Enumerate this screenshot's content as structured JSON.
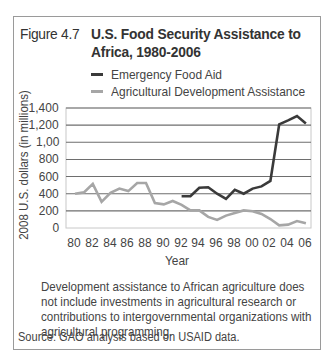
{
  "figure": {
    "number": "Figure 4.7",
    "title": "U.S. Food Security Assistance to Africa, 1980-2006",
    "note": "Development assistance to African agriculture does not include investments in agricultural research or contributions to intergovernmental organizations with agricultural programming.",
    "source": "Source: GAO analysis based on USAID data."
  },
  "colors": {
    "emergency": "#3a3a3a",
    "agricultural": "#a6a6a6",
    "grid": "#6e6e6e",
    "border": "#9a9a9a"
  },
  "chart_data": {
    "type": "line",
    "title": "U.S. Food Security Assistance to Africa, 1980-2006",
    "xlabel": "Year",
    "ylabel": "2008 U.S. dollars (in millions)",
    "ylim": [
      0,
      1400
    ],
    "xlim": [
      1980,
      2006
    ],
    "grid": true,
    "legend_position": "top",
    "y_ticks": [
      0,
      200,
      400,
      600,
      800,
      1000,
      1200,
      1400
    ],
    "y_tick_labels": [
      "0",
      "200",
      "400",
      "600",
      "800",
      "1,00",
      "1,200",
      "1,400"
    ],
    "x_ticks": [
      1980,
      1982,
      1984,
      1986,
      1988,
      1990,
      1992,
      1994,
      1996,
      1998,
      2000,
      2002,
      2004,
      2006
    ],
    "x_tick_labels": [
      "80",
      "82",
      "84",
      "86",
      "88",
      "90",
      "92",
      "94",
      "96",
      "98",
      "00",
      "02",
      "04",
      "06"
    ],
    "series": [
      {
        "name": "Emergency Food Aid",
        "x": [
          1992,
          1993,
          1994,
          1995,
          1996,
          1997,
          1998,
          1999,
          2000,
          2001,
          2002,
          2003,
          2004,
          2005,
          2006
        ],
        "values": [
          370,
          370,
          470,
          475,
          400,
          340,
          445,
          400,
          460,
          485,
          550,
          1210,
          1255,
          1305,
          1220
        ]
      },
      {
        "name": "Agricultural Development Assistance",
        "x": [
          1980,
          1981,
          1982,
          1983,
          1984,
          1985,
          1986,
          1987,
          1988,
          1989,
          1990,
          1991,
          1992,
          1993,
          1994,
          1995,
          1996,
          1997,
          1998,
          1999,
          2000,
          2001,
          2002,
          2003,
          2004,
          2005,
          2006
        ],
        "values": [
          400,
          415,
          515,
          305,
          410,
          460,
          430,
          525,
          525,
          290,
          275,
          315,
          270,
          205,
          205,
          130,
          95,
          145,
          175,
          205,
          195,
          165,
          105,
          30,
          40,
          80,
          55
        ]
      }
    ]
  }
}
